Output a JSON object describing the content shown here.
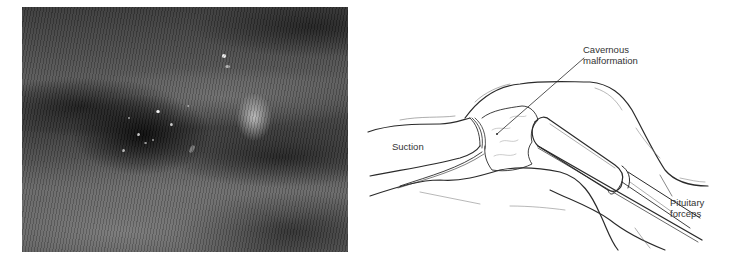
{
  "figure": {
    "photo": {
      "description": "intraoperative-endoscopic-photograph",
      "tone": "grayscale",
      "highlight_color": "#f2f2f2"
    },
    "illustration": {
      "line_color": "#2a2a2a",
      "labels": {
        "cavernous_line1": "Cavernous",
        "cavernous_line2": "malformation",
        "suction": "Suction",
        "pituitary_line1": "Pituitary",
        "pituitary_line2": "forceps"
      }
    }
  }
}
